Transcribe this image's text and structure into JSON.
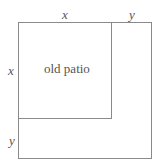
{
  "diagram": {
    "type": "area-model",
    "inner_region": {
      "label": "old patio",
      "side": "x"
    },
    "outer_region": {
      "side": "x + y"
    },
    "labels": {
      "top_inner": "x",
      "top_extension": "y",
      "left_inner": "x",
      "left_extension": "y",
      "center": "old patio"
    },
    "colors": {
      "line": "#8a8a8a",
      "text": "#555555",
      "background": "#ffffff"
    }
  }
}
